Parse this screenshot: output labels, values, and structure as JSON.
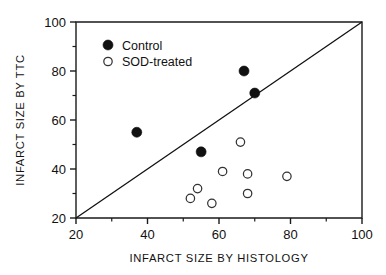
{
  "chart_data": {
    "type": "scatter",
    "title": "",
    "xlabel": "INFARCT SIZE BY HISTOLOGY",
    "ylabel": "INFARCT SIZE BY TTC",
    "xlim": [
      20,
      100
    ],
    "ylim": [
      20,
      100
    ],
    "xticks": [
      20,
      40,
      60,
      80,
      100
    ],
    "yticks": [
      20,
      40,
      60,
      80,
      100
    ],
    "xtick_labels": [
      "20",
      "40",
      "60",
      "80",
      "100"
    ],
    "ytick_labels": [
      "20",
      "40",
      "60",
      "80",
      "100"
    ],
    "minor_ticks_x": [
      30,
      50,
      70,
      90
    ],
    "minor_ticks_y": [
      30,
      50,
      70,
      90
    ],
    "grid": false,
    "legend_position": "top-left",
    "annotations": [
      {
        "name": "identity-line",
        "description": "line of identity y = x",
        "from": [
          20,
          20
        ],
        "to": [
          100,
          100
        ]
      }
    ],
    "series": [
      {
        "name": "Control",
        "marker": "filled-circle",
        "color": "#111111",
        "points": [
          {
            "x": 37,
            "y": 55
          },
          {
            "x": 55,
            "y": 47
          },
          {
            "x": 67,
            "y": 80
          },
          {
            "x": 70,
            "y": 71
          }
        ]
      },
      {
        "name": "SOD-treated",
        "marker": "open-circle",
        "color": "#ffffff",
        "points": [
          {
            "x": 52,
            "y": 28
          },
          {
            "x": 54,
            "y": 32
          },
          {
            "x": 58,
            "y": 26
          },
          {
            "x": 61,
            "y": 39
          },
          {
            "x": 66,
            "y": 51
          },
          {
            "x": 68,
            "y": 38
          },
          {
            "x": 68,
            "y": 30
          },
          {
            "x": 79,
            "y": 37
          }
        ]
      }
    ]
  },
  "legend": {
    "entries": [
      {
        "label": "Control",
        "marker": "filled-circle"
      },
      {
        "label": "SOD-treated",
        "marker": "open-circle"
      }
    ]
  },
  "axes": {
    "x_title": "INFARCT SIZE BY HISTOLOGY",
    "y_title": "INFARCT SIZE BY TTC"
  }
}
